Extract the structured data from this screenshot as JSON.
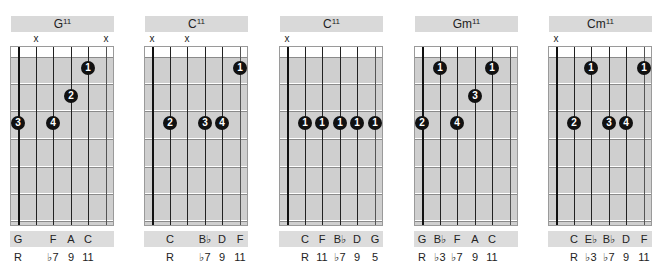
{
  "chords": [
    {
      "name": "G",
      "ext": "11",
      "mutes": [
        "",
        "x",
        "",
        "",
        "",
        "x"
      ],
      "dots": [
        {
          "string": 5,
          "fret": 1,
          "finger": "1"
        },
        {
          "string": 4,
          "fret": 2,
          "finger": "2"
        },
        {
          "string": 1,
          "fret": 3,
          "finger": "3"
        },
        {
          "string": 3,
          "fret": 3,
          "finger": "4"
        }
      ],
      "notes": [
        "G",
        "",
        "F",
        "A",
        "C",
        ""
      ],
      "intervals": [
        "R",
        "",
        "♭7",
        "9",
        "11",
        ""
      ]
    },
    {
      "name": "C",
      "ext": "11",
      "mutes": [
        "x",
        "",
        "x",
        "",
        "",
        ""
      ],
      "dots": [
        {
          "string": 6,
          "fret": 1,
          "finger": "1"
        },
        {
          "string": 2,
          "fret": 3,
          "finger": "2"
        },
        {
          "string": 4,
          "fret": 3,
          "finger": "3"
        },
        {
          "string": 5,
          "fret": 3,
          "finger": "4"
        }
      ],
      "notes": [
        "",
        "C",
        "",
        "B♭",
        "D",
        "F"
      ],
      "intervals": [
        "",
        "R",
        "",
        "♭7",
        "9",
        "11"
      ]
    },
    {
      "name": "C",
      "ext": "11",
      "mutes": [
        "x",
        "",
        "",
        "",
        "",
        ""
      ],
      "dots": [
        {
          "string": 2,
          "fret": 3,
          "finger": "1"
        },
        {
          "string": 3,
          "fret": 3,
          "finger": "1"
        },
        {
          "string": 4,
          "fret": 3,
          "finger": "1"
        },
        {
          "string": 5,
          "fret": 3,
          "finger": "1"
        },
        {
          "string": 6,
          "fret": 3,
          "finger": "1"
        }
      ],
      "notes": [
        "",
        "C",
        "F",
        "B♭",
        "D",
        "G"
      ],
      "intervals": [
        "",
        "R",
        "11",
        "♭7",
        "9",
        "5"
      ]
    },
    {
      "name": "Gm",
      "ext": "11",
      "mutes": [
        "",
        "",
        "",
        "",
        "",
        ""
      ],
      "dots": [
        {
          "string": 2,
          "fret": 1,
          "finger": "1"
        },
        {
          "string": 5,
          "fret": 1,
          "finger": "1"
        },
        {
          "string": 4,
          "fret": 2,
          "finger": "3"
        },
        {
          "string": 1,
          "fret": 3,
          "finger": "2"
        },
        {
          "string": 3,
          "fret": 3,
          "finger": "4"
        }
      ],
      "notes": [
        "G",
        "B♭",
        "F",
        "A",
        "C",
        ""
      ],
      "intervals": [
        "R",
        "♭3",
        "♭7",
        "9",
        "11",
        ""
      ]
    },
    {
      "name": "Cm",
      "ext": "11",
      "mutes": [
        "x",
        "",
        "",
        "",
        "",
        ""
      ],
      "dots": [
        {
          "string": 3,
          "fret": 1,
          "finger": "1"
        },
        {
          "string": 6,
          "fret": 1,
          "finger": "1"
        },
        {
          "string": 2,
          "fret": 3,
          "finger": "2"
        },
        {
          "string": 4,
          "fret": 3,
          "finger": "3"
        },
        {
          "string": 5,
          "fret": 3,
          "finger": "4"
        }
      ],
      "notes": [
        "",
        "C",
        "E♭",
        "B♭",
        "D",
        "F"
      ],
      "intervals": [
        "",
        "R",
        "♭3",
        "♭7",
        "9",
        "11"
      ]
    }
  ]
}
